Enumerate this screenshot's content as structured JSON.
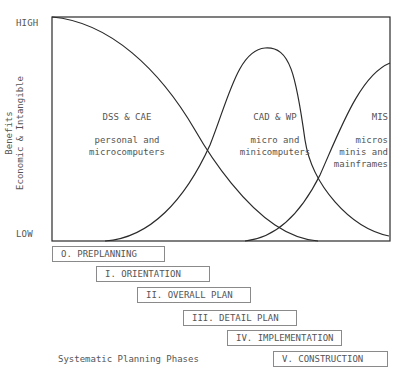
{
  "axis": {
    "high_label": "HIGH",
    "low_label": "LOW",
    "y_label_line1": "Benefits",
    "y_label_line2": "Economic & Intangible"
  },
  "regions": [
    {
      "title": "DSS & CAE",
      "line1": "personal and",
      "line2": "microcomputers",
      "line3": ""
    },
    {
      "title": "CAD & WP",
      "line1": "micro and",
      "line2": "minicomputers",
      "line3": ""
    },
    {
      "title": "MIS",
      "line1": "micros",
      "line2": "minis and",
      "line3": "mainframes"
    }
  ],
  "phases": [
    {
      "label": "O. PREPLANNING"
    },
    {
      "label": "I. ORIENTATION"
    },
    {
      "label": "II. OVERALL PLAN"
    },
    {
      "label": "III. DETAIL PLAN"
    },
    {
      "label": "IV. IMPLEMENTATION"
    },
    {
      "label": "V. CONSTRUCTION"
    }
  ],
  "caption": "Systematic Planning Phases",
  "colors": {
    "line": "#2a2a2a",
    "box_border": "#8a8a8a",
    "text": "#555555"
  }
}
